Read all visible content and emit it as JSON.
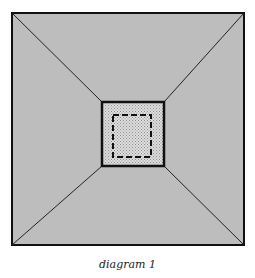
{
  "caption": "diagram 1",
  "colors": {
    "outer_fill": "#bdbdbd",
    "inner_fill": "#d6d6d6",
    "stroke": "#111111"
  },
  "shapes": {
    "outer_square": {
      "x1": 12,
      "y1": 13,
      "x2": 244,
      "y2": 245
    },
    "inner_square": {
      "x1": 102,
      "y1": 102,
      "x2": 164,
      "y2": 166
    },
    "dashed_square": {
      "x1": 113,
      "y1": 115,
      "x2": 151,
      "y2": 157
    }
  }
}
